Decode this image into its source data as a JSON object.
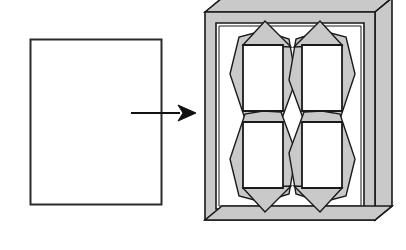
{
  "figure": {
    "title": "Flat blank transformed into packed tray of four folded units",
    "type": "line-drawing",
    "background_color": "#ffffff",
    "stroke_color": "#1a1a1a",
    "gray_fill": "#c9c9c9",
    "gray_fill_light": "#d6d6d6",
    "white_fill": "#ffffff",
    "width": 406,
    "height": 250
  },
  "source_blank": {
    "label": "flat rectangular blank",
    "shape": "rectangle",
    "x": 30,
    "y": 39,
    "width": 131,
    "height": 165,
    "fill": "#ffffff",
    "stroke": "#2b2b2b",
    "stroke_width": 2
  },
  "arrow": {
    "label": "process arrow",
    "direction": "right",
    "shaft": {
      "x1": 131,
      "y1": 113,
      "x2": 180,
      "y2": 113
    },
    "head": {
      "tip_x": 196,
      "tip_y": 113,
      "length": 18,
      "half_height": 8,
      "notch": 5
    },
    "stroke": "#111111",
    "stroke_width": 2
  },
  "tray": {
    "label": "three dimensional tray",
    "outer": {
      "x": 205,
      "y": 12,
      "width": 170,
      "height": 208
    },
    "depth_x": 17,
    "depth_y": 14,
    "rim_width": 11,
    "frame_fill": "#c9c9c9",
    "side_fill": "#c9c9c9",
    "interior_fill": "#ffffff",
    "stroke": "#1a1a1a",
    "stroke_width": 1.6
  },
  "units": {
    "label": "packed units",
    "count": 4,
    "arrangement": "2 by 2 grid",
    "rect_fill": "#ffffff",
    "flap_fill": "#c9c9c9",
    "stroke": "#1a1a1a",
    "items": [
      {
        "name": "unit-top-left",
        "cx": 263,
        "cy": 78,
        "flip_x": false,
        "flip_y": false
      },
      {
        "name": "unit-top-right",
        "cx": 322,
        "cy": 78,
        "flip_x": true,
        "flip_y": false
      },
      {
        "name": "unit-bottom-left",
        "cx": 263,
        "cy": 155,
        "flip_x": false,
        "flip_y": true
      },
      {
        "name": "unit-bottom-right",
        "cx": 322,
        "cy": 155,
        "flip_x": true,
        "flip_y": true
      }
    ],
    "geometry": {
      "rect_width": 40,
      "rect_height": 66,
      "diamond_half_width": 33,
      "diamond_half_height": 38,
      "apex_offset": 22
    }
  }
}
